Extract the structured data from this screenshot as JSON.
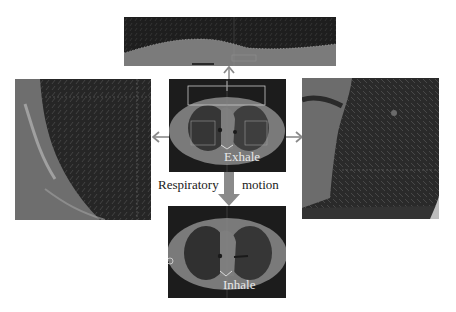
{
  "figure": {
    "top_panel": {
      "description": "Zoomed anterior chest wall with motion vector field"
    },
    "left_panel": {
      "description": "Zoomed left lung region with motion vector field"
    },
    "right_panel": {
      "description": "Zoomed right lung region with motion vector field"
    },
    "exhale_panel": {
      "label": "Exhale"
    },
    "inhale_panel": {
      "label": "Inhale"
    },
    "motion_label": {
      "left": "Respiratory",
      "right": "motion"
    },
    "colors": {
      "background": "#ffffff",
      "ct_dark": "#1c1c1c",
      "ct_tissue": "#7a7a7a",
      "lung": "#3a3a3a",
      "arrow": "#8a8a8a",
      "roi_box": "#c8c8c8"
    }
  }
}
